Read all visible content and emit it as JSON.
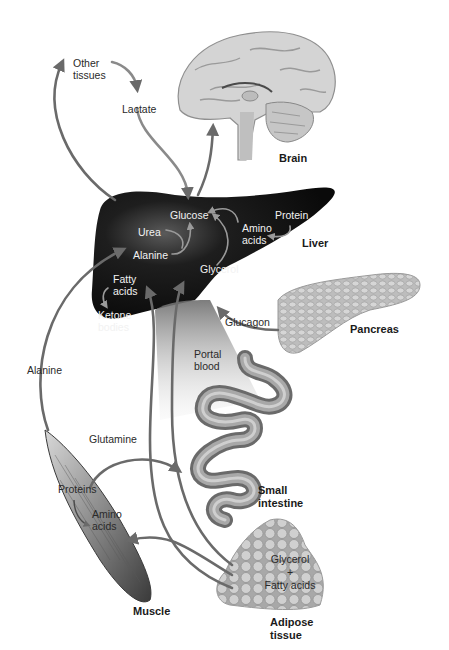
{
  "diagram": {
    "organs": {
      "brain": "Brain",
      "liver": "Liver",
      "pancreas": "Pancreas",
      "small_intestine": [
        "Small",
        "intestine"
      ],
      "muscle": "Muscle",
      "adipose": [
        "Adipose",
        "tissue"
      ]
    },
    "labels": {
      "other_tissues": [
        "Other",
        "tissues"
      ],
      "lactate": "Lactate",
      "glucose": "Glucose",
      "urea": "Urea",
      "alanine_liver": "Alanine",
      "protein": "Protein",
      "amino_acids_liver": [
        "Amino",
        "acids"
      ],
      "glycerol_liver": "Glycerol",
      "fatty_acids_liver": [
        "Fatty",
        "acids"
      ],
      "ketone_bodies": [
        "Ketone",
        "bodies"
      ],
      "glucagon": "Glucagon",
      "portal_blood": [
        "Portal",
        "blood"
      ],
      "alanine_left": "Alanine",
      "glutamine": "Glutamine",
      "proteins_muscle": "Proteins",
      "amino_acids_muscle": [
        "Amino",
        "acids"
      ],
      "glycerol_adipose": "Glycerol",
      "plus": "+",
      "fatty_acids_adipose": "Fatty acids"
    },
    "flows": [
      {
        "from": "Liver",
        "to": "Other tissues",
        "substance": "Glucose"
      },
      {
        "from": "Other tissues",
        "to": "Lactate"
      },
      {
        "from": "Lactate",
        "to": "Liver (Glucose)"
      },
      {
        "from": "Liver (Glucose)",
        "to": "Brain"
      },
      {
        "from": "Urea",
        "to": "Glucose"
      },
      {
        "from": "Alanine",
        "to": "Glucose"
      },
      {
        "from": "Glycerol",
        "to": "Glucose"
      },
      {
        "from": "Amino acids",
        "to": "Glucose"
      },
      {
        "from": "Protein",
        "to": "Amino acids"
      },
      {
        "from": "Fatty acids",
        "to": "Ketone bodies"
      },
      {
        "from": "Pancreas",
        "to": "Liver",
        "substance": "Glucagon"
      },
      {
        "from": "Muscle",
        "to": "Liver",
        "substance": "Alanine"
      },
      {
        "from": "Muscle",
        "to": "Small intestine",
        "substance": "Glutamine"
      },
      {
        "from": "Proteins",
        "to": "Amino acids",
        "location": "Muscle"
      },
      {
        "from": "Adipose tissue",
        "to": "Liver",
        "substance": "Glycerol + Fatty acids"
      },
      {
        "from": "Adipose tissue",
        "to": "Muscle",
        "substance": "Fatty acids"
      }
    ]
  }
}
